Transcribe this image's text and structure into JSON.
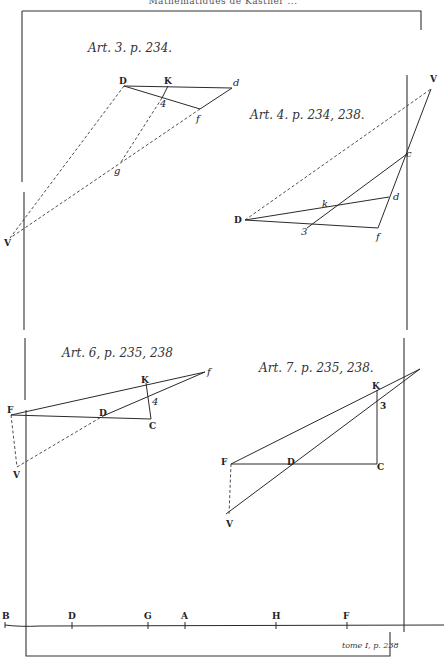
{
  "plate": {
    "header_text": "Mathématiques de Kästner ...",
    "footer_text": "tome I, p. 238",
    "colors": {
      "ink": "#2a2a2a",
      "paper": "#ffffff"
    }
  },
  "figures": [
    {
      "id": "art3",
      "caption": "Art. 3. p. 234.",
      "points": {
        "D": "D",
        "K": "K",
        "d": "d",
        "f": "f",
        "4": "4",
        "g": "g",
        "V": "V"
      }
    },
    {
      "id": "art4",
      "caption": "Art. 4. p. 234, 238.",
      "points": {
        "V": "V",
        "c": "c",
        "d": "d",
        "k": "k",
        "D": "D",
        "3": "3",
        "f": "f"
      }
    },
    {
      "id": "art6",
      "caption": "Art. 6, p. 235, 238",
      "points": {
        "f": "f",
        "K": "K",
        "4": "4",
        "F": "F",
        "D": "D",
        "C": "C",
        "V": "V"
      }
    },
    {
      "id": "art7",
      "caption": "Art. 7. p. 235, 238.",
      "points": {
        "K": "K",
        "3": "3",
        "F": "F",
        "D": "D",
        "C": "C",
        "V": "V"
      }
    }
  ],
  "scale_line": {
    "points": [
      {
        "label": "B",
        "x": 5
      },
      {
        "label": "D",
        "x": 72
      },
      {
        "label": "G",
        "x": 148
      },
      {
        "label": "A",
        "x": 185
      },
      {
        "label": "H",
        "x": 276
      },
      {
        "label": "F",
        "x": 347
      }
    ]
  }
}
